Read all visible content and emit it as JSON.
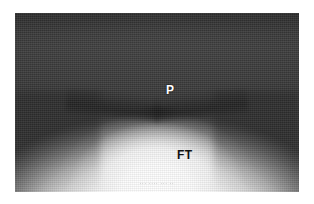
{
  "image": {
    "kind": "ultrasound-scan",
    "modality_hint": "grayscale B-mode sonogram",
    "frame": {
      "left_px": 15,
      "top_px": 13,
      "width_px": 284,
      "height_px": 179
    }
  },
  "colors": {
    "page_background": "#ffffff",
    "field_dark": "#3a3a3a",
    "field_dark_top": "#333333",
    "dome_bright": "#fafafa",
    "dome_core": "#ffffff",
    "label_light": "#ffffff",
    "label_dark": "#101010",
    "annotation_gray": "#5a5a5a"
  },
  "annotations": [
    {
      "id": "label-p",
      "text": "P",
      "meaning": "placenta",
      "color": "#ffffff",
      "x_px": 151,
      "y_px": 71
    },
    {
      "id": "label-ft",
      "text": "FT",
      "meaning": "fetal tissue",
      "color": "#101010",
      "x_px": 162,
      "y_px": 136
    }
  ],
  "footer": {
    "annotation_text": "··· ···· ··· ··",
    "legible": false
  }
}
